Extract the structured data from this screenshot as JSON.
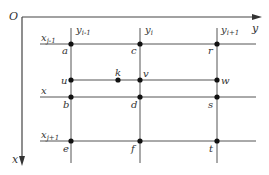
{
  "diagram": {
    "origin_label": "O",
    "x_axis_label": "x",
    "y_axis_label": "y",
    "column_labels": [
      {
        "main": "y",
        "sub": "i-1"
      },
      {
        "main": "y",
        "sub": "i"
      },
      {
        "main": "y",
        "sub": "i+1"
      }
    ],
    "row_labels": [
      {
        "main": "x",
        "sub": "j-1"
      },
      {
        "main": "x",
        "sub": ""
      },
      {
        "main": "x",
        "sub": "j+1"
      }
    ],
    "points": [
      {
        "label": "a"
      },
      {
        "label": "c"
      },
      {
        "label": "r"
      },
      {
        "label": "u"
      },
      {
        "label": "k"
      },
      {
        "label": "v"
      },
      {
        "label": "w"
      },
      {
        "label": "b"
      },
      {
        "label": "d"
      },
      {
        "label": "s"
      },
      {
        "label": "e"
      },
      {
        "label": "f"
      },
      {
        "label": "t"
      }
    ]
  }
}
